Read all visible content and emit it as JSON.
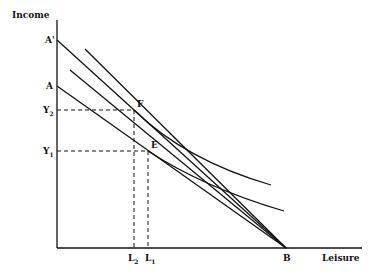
{
  "diagram": {
    "axes": {
      "y_label": "Income",
      "x_label": "Leisure"
    },
    "points": {
      "A_prime": "A'",
      "A": "A",
      "B": "B",
      "F": "F",
      "E": "E"
    },
    "y_ticks": [
      {
        "label": "Y",
        "sub": "2"
      },
      {
        "label": "Y",
        "sub": "1"
      }
    ],
    "x_ticks": [
      {
        "label": "L",
        "sub": "2"
      },
      {
        "label": "L",
        "sub": "1"
      }
    ],
    "lines": [
      {
        "name": "budget-line-A-prime-B",
        "from": "A'",
        "to": "B"
      },
      {
        "name": "budget-line-A-B",
        "from": "A",
        "to": "B"
      }
    ],
    "curves": [
      {
        "name": "indifference-curve-upper",
        "tangent_at": "F"
      },
      {
        "name": "indifference-curve-lower",
        "tangent_at": "E"
      }
    ],
    "colors": {
      "ink": "#111111",
      "background": "#ffffff"
    }
  }
}
